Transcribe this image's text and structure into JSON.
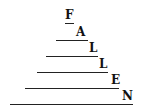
{
  "word": "FALLEN",
  "letters": [
    "F",
    "A",
    "L",
    "L",
    "E",
    "N"
  ],
  "colors": {
    "ink": "#111111",
    "background": "#ffffff"
  }
}
